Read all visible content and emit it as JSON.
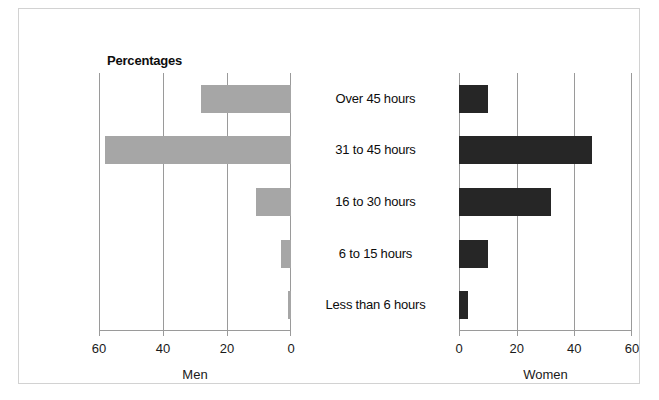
{
  "chart_data": {
    "type": "bar",
    "title": "Percentages",
    "orientation": "horizontal",
    "layout": "back-to-back pyramid (two panels sharing centered category labels)",
    "categories": [
      "Over 45 hours",
      "31 to 45 hours",
      "16 to 30 hours",
      "6 to 15 hours",
      "Less than 6 hours"
    ],
    "series": [
      {
        "name": "Men",
        "color": "#a6a6a6",
        "axis_direction": "right-to-left",
        "values": [
          28,
          58,
          11,
          3,
          1
        ]
      },
      {
        "name": "Women",
        "color": "#262626",
        "axis_direction": "left-to-right",
        "values": [
          10,
          46,
          32,
          10,
          3
        ]
      }
    ],
    "xlabel_left": "Men",
    "xlabel_right": "Women",
    "ylabel": "",
    "xlim": [
      0,
      60
    ],
    "xticks": [
      0,
      20,
      40,
      60
    ],
    "xticks_left_order": [
      "60",
      "40",
      "20",
      "0"
    ],
    "xticks_right_order": [
      "0",
      "20",
      "40",
      "60"
    ],
    "grid": true,
    "legend": "none"
  },
  "left_panel": {
    "axis_title": "Men",
    "ticks": [
      "60",
      "40",
      "20",
      "0"
    ],
    "bars": [
      {
        "category": "Over 45 hours",
        "value": 28
      },
      {
        "category": "31 to 45 hours",
        "value": 58
      },
      {
        "category": "16 to 30 hours",
        "value": 11
      },
      {
        "category": "6 to 15 hours",
        "value": 3
      },
      {
        "category": "Less than 6 hours",
        "value": 1
      }
    ]
  },
  "right_panel": {
    "axis_title": "Women",
    "ticks": [
      "0",
      "20",
      "40",
      "60"
    ],
    "bars": [
      {
        "category": "Over 45 hours",
        "value": 10
      },
      {
        "category": "31 to 45 hours",
        "value": 46
      },
      {
        "category": "16 to 30 hours",
        "value": 32
      },
      {
        "category": "6 to 15 hours",
        "value": 10
      },
      {
        "category": "Less than 6 hours",
        "value": 3
      }
    ]
  },
  "categories": [
    "Over 45 hours",
    "31 to 45 hours",
    "16 to 30 hours",
    "6 to 15 hours",
    "Less than 6 hours"
  ],
  "colors": {
    "men_bar": "#a6a6a6",
    "women_bar": "#262626",
    "axis": "#9a9a9a",
    "text": "#0d0d0d",
    "frame": "#d2d2d2",
    "background": "#ffffff"
  }
}
